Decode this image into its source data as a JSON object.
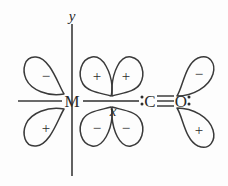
{
  "figure": {
    "background_color": "#fdfdfd",
    "line_color": "#3a3a3a",
    "width": 228,
    "height": 186
  },
  "axes": {
    "y_label": "y",
    "x_label": "x",
    "vertical": {
      "x": 72,
      "y_top": 24,
      "y_bottom": 176
    },
    "horizontal": {
      "y": 101,
      "x_left": 18,
      "x_right": 136
    }
  },
  "atoms": {
    "metal": {
      "label": "M",
      "x": 72,
      "y": 101
    },
    "carbon": {
      "label": "C",
      "x": 150,
      "y": 101
    },
    "oxygen": {
      "label": "O",
      "x": 180,
      "y": 101
    },
    "carbon_lone_pair": ":",
    "oxygen_lone_pair": ":"
  },
  "bond": {
    "metal_carbon_label": "single",
    "carbon_oxygen_label": "triple",
    "triple_bond_lines": 3
  },
  "orbitals": [
    {
      "name": "metal-d-upper-left",
      "sign": "−",
      "cx": 46,
      "cy": 76
    },
    {
      "name": "metal-d-lower-left",
      "sign": "+",
      "cx": 46,
      "cy": 128
    },
    {
      "name": "metal-d-upper-inner-left",
      "sign": "+",
      "cx": 97,
      "cy": 76
    },
    {
      "name": "metal-d-upper-inner-right",
      "sign": "+",
      "cx": 125,
      "cy": 76
    },
    {
      "name": "metal-d-lower-inner-left",
      "sign": "−",
      "cx": 97,
      "cy": 128
    },
    {
      "name": "metal-d-lower-inner-right",
      "sign": "−",
      "cx": 125,
      "cy": 128
    },
    {
      "name": "co-pi-star-upper-right",
      "sign": "−",
      "cx": 198,
      "cy": 74
    },
    {
      "name": "co-pi-star-lower-right",
      "sign": "+",
      "cx": 198,
      "cy": 130
    }
  ]
}
